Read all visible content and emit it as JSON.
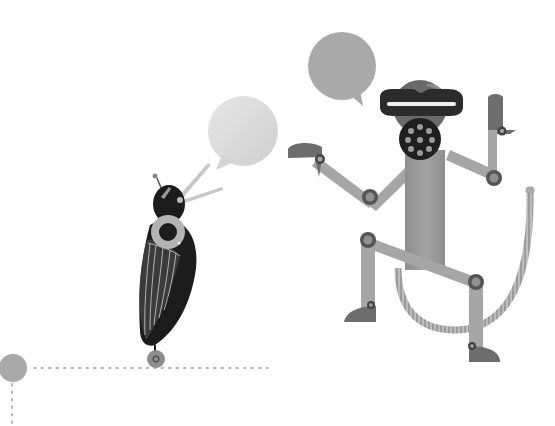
{
  "illustration": {
    "title": "Robot characters illustration",
    "description": "A beetle-like robot and a monkey-like robot with speech bubbles",
    "colors": {
      "background": "#ffffff",
      "bubble_light": "#d9d9d9",
      "bubble_mid": "#a9a9a9",
      "dark": "#1c1c1c",
      "body_gray": "#9a9a9a",
      "limb_gray": "#a6a6a6",
      "joint_dark": "#5a5a5a",
      "foot_dark": "#6d6d6d",
      "dots": "#b5b5b5",
      "node": "#a8a8a8"
    },
    "characters": [
      {
        "name": "beetle-robot",
        "bubble": "empty"
      },
      {
        "name": "monkey-robot",
        "bubble": "empty"
      }
    ]
  }
}
